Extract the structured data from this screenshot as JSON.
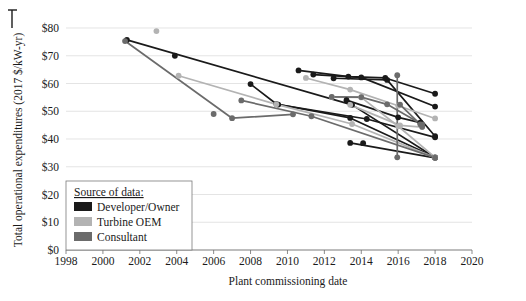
{
  "chart_data": {
    "type": "line",
    "title": "",
    "xlabel": "Plant commissioning date",
    "ylabel": "Total operational expenditures (2017 $/kW-yr)",
    "xlim": [
      1998,
      2020
    ],
    "ylim": [
      0,
      80
    ],
    "xticks": [
      1998,
      2000,
      2002,
      2004,
      2006,
      2008,
      2010,
      2012,
      2014,
      2016,
      2018,
      2020
    ],
    "xtick_labels": [
      "1998",
      "2000",
      "2002",
      "2004",
      "2006",
      "2008",
      "2010",
      "2012",
      "2014",
      "2016",
      "2018",
      "2020"
    ],
    "yticks": [
      0,
      10,
      20,
      30,
      40,
      50,
      60,
      70,
      80
    ],
    "ytick_labels": [
      "$0",
      "$10",
      "$20",
      "$30",
      "$40",
      "$50",
      "$60",
      "$70",
      "$80"
    ],
    "grid": "horizontal",
    "legend_position": "lower-left",
    "legend_title": "Source of data:",
    "colors": {
      "developer_owner": "#1a1a1a",
      "turbine_oem": "#b3b3b3",
      "consultant": "#6b6b6b"
    },
    "legend_entries": [
      {
        "label": "Developer/Owner",
        "color": "#1a1a1a"
      },
      {
        "label": "Turbine OEM",
        "color": "#b3b3b3"
      },
      {
        "label": "Consultant",
        "color": "#6b6b6b"
      }
    ],
    "series": [
      {
        "name": "Developer/Owner A",
        "source": "developer_owner",
        "color": "#1a1a1a",
        "points": [
          [
            2001.3,
            75.7
          ],
          [
            2013.5,
            52.3
          ],
          [
            2018.0,
            33.3
          ]
        ]
      },
      {
        "name": "Developer/Owner B",
        "source": "developer_owner",
        "color": "#1a1a1a",
        "points": [
          [
            2008.0,
            59.8
          ],
          [
            2009.4,
            52.6
          ],
          [
            2013.4,
            47.6
          ],
          [
            2018.0,
            33.4
          ]
        ]
      },
      {
        "name": "Developer/Owner C",
        "source": "developer_owner",
        "color": "#1a1a1a",
        "points": [
          [
            2010.6,
            64.7
          ],
          [
            2013.3,
            62.5
          ],
          [
            2015.3,
            62.0
          ],
          [
            2018.0,
            56.3
          ]
        ]
      },
      {
        "name": "Developer/Owner D",
        "source": "developer_owner",
        "color": "#1a1a1a",
        "points": [
          [
            2011.4,
            63.2
          ],
          [
            2014.0,
            62.2
          ],
          [
            2018.0,
            51.7
          ]
        ]
      },
      {
        "name": "Developer/Owner E",
        "source": "developer_owner",
        "color": "#1a1a1a",
        "points": [
          [
            2012.5,
            61.9
          ],
          [
            2015.4,
            61.3
          ],
          [
            2018.0,
            41.0
          ]
        ]
      },
      {
        "name": "Developer/Owner F",
        "source": "developer_owner",
        "color": "#1a1a1a",
        "points": [
          [
            2013.2,
            54.0
          ],
          [
            2016.0,
            47.8
          ],
          [
            2017.2,
            45.9
          ]
        ]
      },
      {
        "name": "Developer/Owner G",
        "source": "developer_owner",
        "color": "#1a1a1a",
        "points": [
          [
            2009.5,
            52.4
          ],
          [
            2014.3,
            47.2
          ],
          [
            2018.0,
            40.6
          ]
        ]
      },
      {
        "name": "Developer/Owner H",
        "source": "developer_owner",
        "color": "#1a1a1a",
        "points": [
          [
            2013.4,
            38.6
          ],
          [
            2018.0,
            33.2
          ]
        ]
      },
      {
        "name": "Developer/Owner single 2004",
        "source": "developer_owner",
        "color": "#1a1a1a",
        "points": [
          [
            2003.9,
            70.0
          ]
        ]
      },
      {
        "name": "Developer/Owner single 2014",
        "source": "developer_owner",
        "color": "#1a1a1a",
        "points": [
          [
            2014.1,
            38.5
          ]
        ]
      },
      {
        "name": "Turbine OEM A",
        "source": "turbine_oem",
        "color": "#b3b3b3",
        "points": [
          [
            2004.1,
            62.8
          ],
          [
            2009.4,
            52.5
          ],
          [
            2013.5,
            45.4
          ],
          [
            2018.0,
            33.3
          ]
        ]
      },
      {
        "name": "Turbine OEM B",
        "source": "turbine_oem",
        "color": "#b3b3b3",
        "points": [
          [
            2011.0,
            62.0
          ],
          [
            2013.4,
            57.8
          ],
          [
            2016.0,
            52.0
          ],
          [
            2018.0,
            47.4
          ]
        ]
      },
      {
        "name": "Turbine OEM C",
        "source": "turbine_oem",
        "color": "#b3b3b3",
        "points": [
          [
            2012.4,
            55.1
          ],
          [
            2014.0,
            55.0
          ],
          [
            2016.0,
            44.6
          ],
          [
            2018.0,
            33.4
          ]
        ]
      },
      {
        "name": "Turbine OEM D",
        "source": "turbine_oem",
        "color": "#b3b3b3",
        "points": [
          [
            2013.4,
            52.3
          ],
          [
            2016.1,
            44.9
          ],
          [
            2017.3,
            44.3
          ]
        ]
      },
      {
        "name": "Turbine OEM single 2003",
        "source": "turbine_oem",
        "color": "#b3b3b3",
        "points": [
          [
            2002.9,
            78.9
          ]
        ]
      },
      {
        "name": "Consultant A",
        "source": "consultant",
        "color": "#6b6b6b",
        "points": [
          [
            2001.2,
            75.3
          ],
          [
            2007.0,
            47.5
          ],
          [
            2010.3,
            48.9
          ]
        ]
      },
      {
        "name": "Consultant B",
        "source": "consultant",
        "color": "#6b6b6b",
        "points": [
          [
            2007.5,
            53.9
          ],
          [
            2011.3,
            48.2
          ],
          [
            2018.0,
            33.3
          ]
        ]
      },
      {
        "name": "Consultant C",
        "source": "consultant",
        "color": "#6b6b6b",
        "points": [
          [
            2012.4,
            55.2
          ],
          [
            2014.0,
            55.1
          ],
          [
            2015.4,
            52.5
          ],
          [
            2017.3,
            45.2
          ]
        ]
      },
      {
        "name": "Consultant D",
        "source": "consultant",
        "color": "#6b6b6b",
        "points": [
          [
            2016.1,
            52.4
          ],
          [
            2017.2,
            45.3
          ],
          [
            2017.3,
            44.4
          ]
        ]
      },
      {
        "name": "Consultant E",
        "source": "consultant",
        "color": "#6b6b6b",
        "points": [
          [
            2006.0,
            49.0
          ]
        ]
      },
      {
        "name": "Consultant vertical 2016",
        "source": "consultant",
        "color": "#6b6b6b",
        "points": [
          [
            2015.95,
            63.0
          ],
          [
            2015.95,
            33.4
          ]
        ]
      }
    ]
  }
}
